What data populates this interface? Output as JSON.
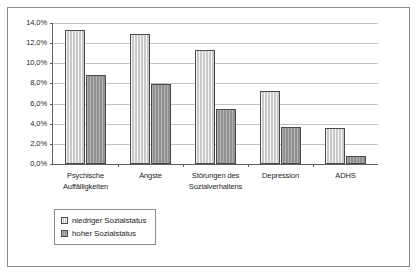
{
  "chart_data": {
    "type": "bar",
    "title": "",
    "subtitle": "",
    "xlabel": "",
    "ylabel": "",
    "categories": [
      "Psychische Auffälligkeiten",
      "Ängste",
      "Störungen des Sozialverhaltens",
      "Depression",
      "ADHS"
    ],
    "category_lines": [
      [
        "Psychische",
        "Auffälligkeiten"
      ],
      [
        "Ängste"
      ],
      [
        "Störungen des",
        "Sozialverhaltens"
      ],
      [
        "Depression"
      ],
      [
        "ADHS"
      ]
    ],
    "series": [
      {
        "name": "niedriger Sozialstatus",
        "values": [
          13.3,
          12.9,
          11.3,
          7.2,
          3.6
        ],
        "color": "#c9c9c9"
      },
      {
        "name": "hoher Sozialstatus",
        "values": [
          8.8,
          7.9,
          5.5,
          3.7,
          0.8
        ],
        "color": "#919191"
      }
    ],
    "ylim": [
      0.0,
      14.0
    ],
    "ytick_values": [
      14.0,
      12.0,
      10.0,
      8.0,
      6.0,
      4.0,
      2.0,
      0.0
    ],
    "ytick_labels": [
      "14,0%",
      "12,0%",
      "10,0%",
      "8,0%",
      "6,0%",
      "4,0%",
      "2,0%",
      "0,0%"
    ],
    "grid": true,
    "legend_position": "below-left",
    "legend_entries": [
      "niedriger Sozialstatus",
      "hoher Sozialstatus"
    ]
  }
}
